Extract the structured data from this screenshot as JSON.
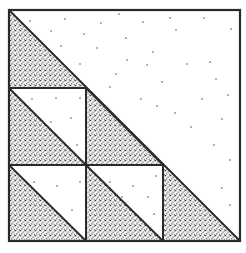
{
  "figure": {
    "type": "quilt-block-diagram",
    "colors": {
      "background": "#ffffff",
      "line": "#2a2a2a",
      "stipple": "#3a3a3a",
      "sparse_dot": "#555555"
    },
    "grid": {
      "rows": 3,
      "cols": 3
    },
    "caption": ""
  }
}
